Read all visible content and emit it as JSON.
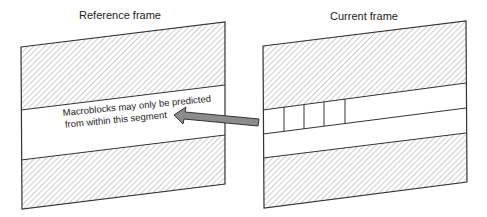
{
  "diagram": {
    "reference_frame": {
      "title": "Reference frame",
      "annotation_line1": "Macroblocks may only be predicted",
      "annotation_line2": "from within this segment"
    },
    "current_frame": {
      "title": "Current frame",
      "macroblock_count": 4
    },
    "arrow": {
      "direction": "current-to-reference",
      "fill": "#8c8c8c",
      "stroke": "#333333"
    },
    "colors": {
      "outline": "#333333",
      "hatch": "#9a9a9a",
      "background": "#ffffff"
    }
  }
}
